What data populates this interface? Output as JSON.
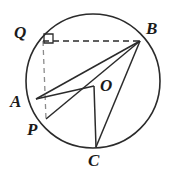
{
  "figure": {
    "background_color": "#ffffff",
    "stroke_color": "#2b2b2b",
    "label_color": "#1a1a1a",
    "labels": {
      "Q": "Q",
      "B": "B",
      "A": "A",
      "O": "O",
      "P": "P",
      "C": "C"
    },
    "points": {
      "Q": {
        "x": 43,
        "y": 41
      },
      "B": {
        "x": 140,
        "y": 41
      },
      "A": {
        "x": 36,
        "y": 99
      },
      "O": {
        "x": 94,
        "y": 86
      },
      "P": {
        "x": 46,
        "y": 119
      },
      "C": {
        "x": 96,
        "y": 147
      }
    },
    "circle": {
      "center_x": 93,
      "center_y": 81,
      "radius": 67
    },
    "segments": [
      {
        "name": "QB",
        "from": "Q",
        "to": "B",
        "style": "dashed"
      },
      {
        "name": "QP",
        "from": "Q",
        "to": "P",
        "style": "dashed"
      },
      {
        "name": "BA",
        "from": "B",
        "to": "A",
        "style": "solid"
      },
      {
        "name": "BP",
        "from": "B",
        "to": "P",
        "style": "solid"
      },
      {
        "name": "BC",
        "from": "B",
        "to": "C",
        "style": "solid"
      },
      {
        "name": "AO",
        "from": "A",
        "to": "O",
        "style": "solid"
      },
      {
        "name": "OC",
        "from": "O",
        "to": "C",
        "style": "solid"
      }
    ],
    "markers": [
      {
        "name": "right-angle-at-Q",
        "x": 44,
        "y": 42,
        "size": 9
      }
    ]
  }
}
